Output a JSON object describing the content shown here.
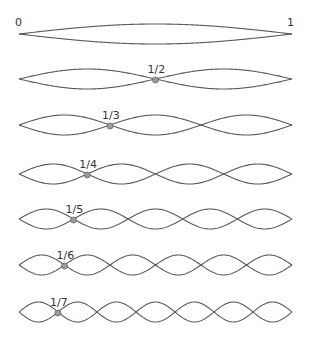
{
  "diagram": {
    "endpoint_labels": {
      "start": "0",
      "end": "1"
    },
    "x_start": 19,
    "x_end": 292,
    "amplitude": 10,
    "colors": {
      "line": "#5a5a5a",
      "node_fill": "#9a9a9a",
      "node_stroke": "#6a6a6a",
      "label": "#333333",
      "background": "#ffffff"
    },
    "rows": [
      {
        "harmonic": 1,
        "center_y": 34,
        "node_label": "",
        "marked_node": null
      },
      {
        "harmonic": 2,
        "center_y": 79,
        "node_label": "1/2",
        "marked_node": 1
      },
      {
        "harmonic": 3,
        "center_y": 125,
        "node_label": "1/3",
        "marked_node": 1
      },
      {
        "harmonic": 4,
        "center_y": 174,
        "node_label": "1/4",
        "marked_node": 1
      },
      {
        "harmonic": 5,
        "center_y": 219,
        "node_label": "1/5",
        "marked_node": 1
      },
      {
        "harmonic": 6,
        "center_y": 265,
        "node_label": "1/6",
        "marked_node": 1
      },
      {
        "harmonic": 7,
        "center_y": 312,
        "node_label": "1/7",
        "marked_node": 1
      }
    ]
  }
}
